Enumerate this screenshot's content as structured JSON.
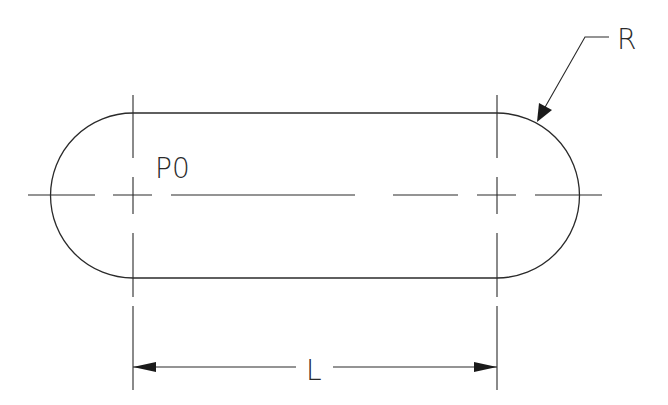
{
  "drawing": {
    "type": "slot / obround technical drawing",
    "labels": {
      "point": "P0",
      "length": "L",
      "radius": "R"
    },
    "colors": {
      "line": "#2a2a2a",
      "background": "#ffffff"
    }
  }
}
